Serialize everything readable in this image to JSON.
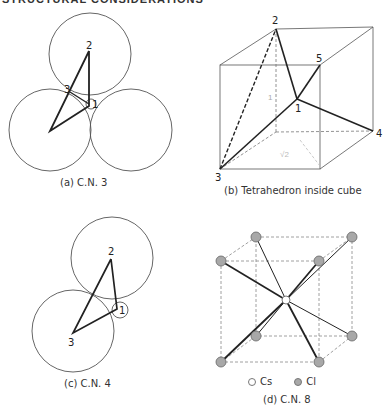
{
  "header": {
    "title": "STRUCTURAL CONSIDERATIONS"
  },
  "panels": {
    "a": {
      "caption": "(a)  C.N. 3",
      "labels": [
        "1",
        "2",
        "3"
      ]
    },
    "b": {
      "caption": "(b)  Tetrahedron inside cube",
      "labels": [
        "1",
        "2",
        "3",
        "4",
        "5"
      ],
      "faint_annotations": [
        "1",
        "√2"
      ]
    },
    "c": {
      "caption": "(c)  C.N. 4",
      "labels": [
        "1",
        "2",
        "3"
      ]
    },
    "d": {
      "caption": "(d)  C.N. 8",
      "legend": [
        {
          "label": "Cs",
          "color": "#ffffff"
        },
        {
          "label": "Cl",
          "color": "#a8a8a8"
        }
      ]
    }
  },
  "colors": {
    "line": "#222222",
    "thin_line": "#555555",
    "dashed": "#777777",
    "atom_cl": "#a8a8a8"
  }
}
